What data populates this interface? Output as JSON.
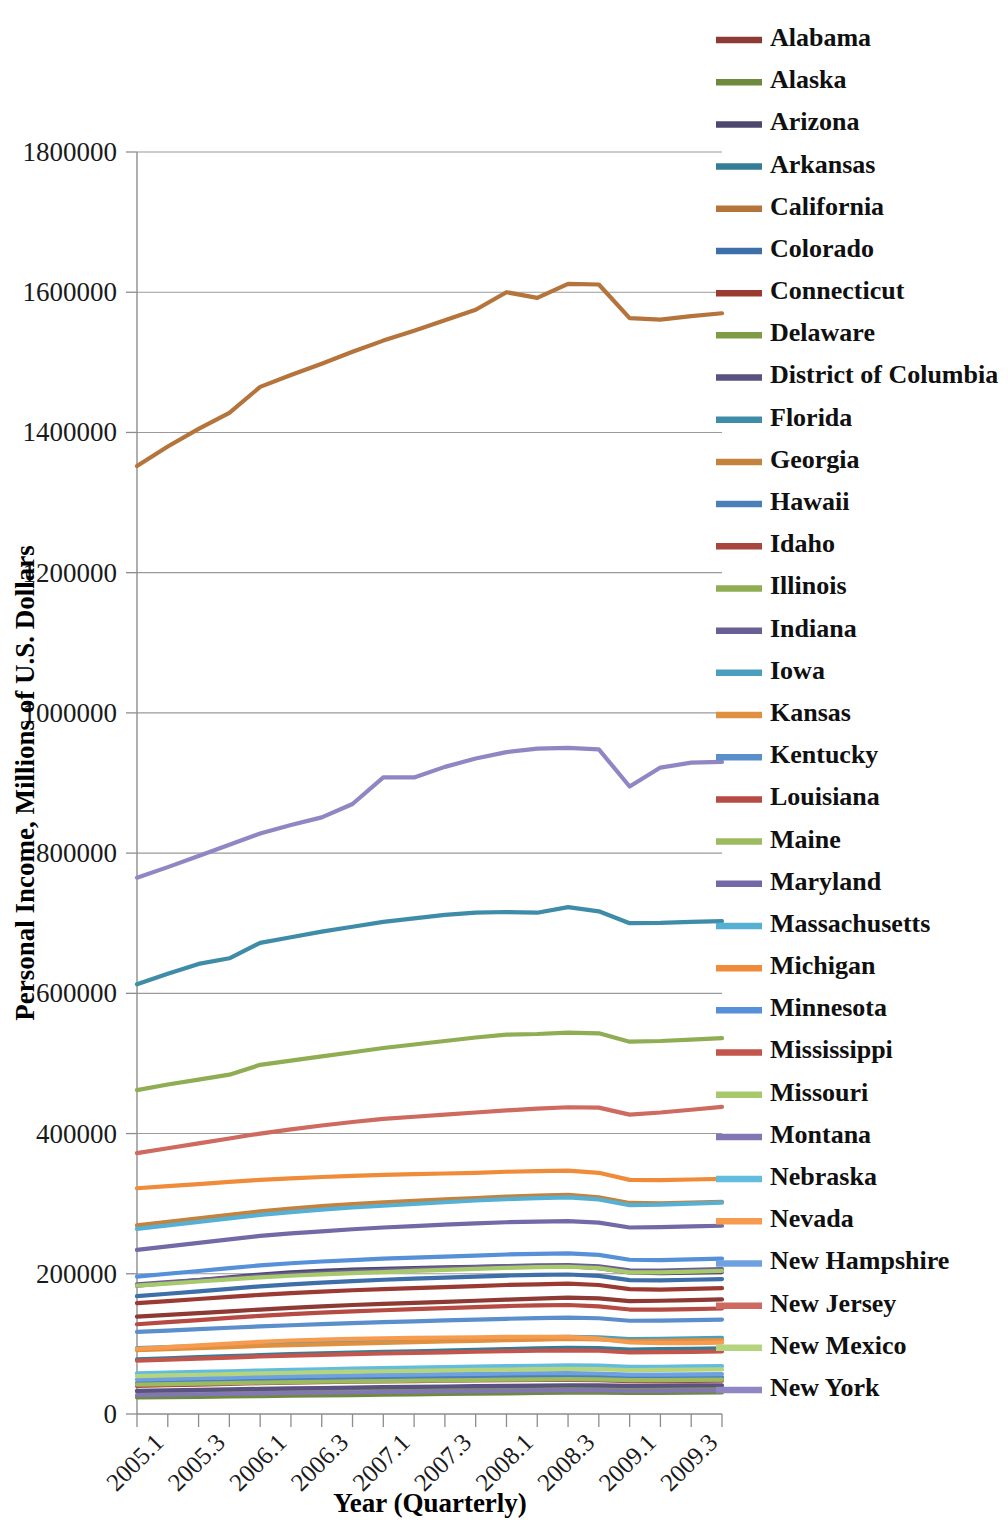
{
  "chart_data": {
    "type": "line",
    "title": "",
    "xlabel": "Year (Quarterly)",
    "ylabel": "Personal Income, Millions of U.S. Dollars",
    "grid": true,
    "legend_position": "right",
    "ylim": [
      0,
      1800000
    ],
    "yticks": [
      "0",
      "200000",
      "400000",
      "600000",
      "800000",
      "1000000",
      "1200000",
      "1400000",
      "1600000",
      "1800000"
    ],
    "ytick_values": [
      0,
      200000,
      400000,
      600000,
      800000,
      1000000,
      1200000,
      1400000,
      1600000,
      1800000
    ],
    "x": [
      "2005.1",
      "2005.2",
      "2005.3",
      "2005.4",
      "2006.1",
      "2006.2",
      "2006.3",
      "2006.4",
      "2007.1",
      "2007.2",
      "2007.3",
      "2007.4",
      "2008.1",
      "2008.2",
      "2008.3",
      "2008.4",
      "2009.1",
      "2009.2",
      "2009.3",
      "2009.4"
    ],
    "xtick_labels": [
      "2005.1",
      "2005.3",
      "2006.1",
      "2006.3",
      "2007.1",
      "2007.3",
      "2008.1",
      "2008.3",
      "2009.1",
      "2009.3"
    ],
    "xtick_indices": [
      0,
      2,
      4,
      6,
      8,
      10,
      12,
      14,
      16,
      18
    ],
    "series": [
      {
        "name": "Alabama",
        "color": "#8C3A33",
        "values": [
          139000,
          141500,
          144000,
          146500,
          149000,
          151500,
          153500,
          155500,
          157000,
          158500,
          160000,
          161500,
          163000,
          164500,
          166000,
          165000,
          161000,
          161500,
          162500,
          163500
        ]
      },
      {
        "name": "Alaska",
        "color": "#6E8B3D",
        "values": [
          23500,
          24000,
          24500,
          25000,
          25500,
          26000,
          26500,
          27000,
          27500,
          28000,
          28500,
          29000,
          29500,
          30000,
          30500,
          30500,
          30000,
          30200,
          30500,
          30800
        ]
      },
      {
        "name": "Arizona",
        "color": "#4F4770",
        "values": [
          183000,
          187000,
          191000,
          195000,
          199000,
          202000,
          204000,
          206000,
          207000,
          208000,
          209000,
          210000,
          210500,
          211000,
          211000,
          208000,
          202000,
          201000,
          201500,
          202500
        ]
      },
      {
        "name": "Arkansas",
        "color": "#357C96",
        "values": [
          78000,
          79500,
          81000,
          82500,
          84000,
          85500,
          86500,
          87500,
          88500,
          89500,
          90500,
          91500,
          92500,
          93500,
          94500,
          94000,
          92000,
          92500,
          93000,
          93500
        ]
      },
      {
        "name": "California",
        "color": "#B5743C",
        "values": [
          1352000,
          1380000,
          1405000,
          1428000,
          1465000,
          1482000,
          1498000,
          1515000,
          1531000,
          1545000,
          1560000,
          1575000,
          1600000,
          1592000,
          1612000,
          1611000,
          1563000,
          1561000,
          1566000,
          1570000
        ]
      },
      {
        "name": "Colorado",
        "color": "#3E6FA8",
        "values": [
          168000,
          171500,
          175000,
          178500,
          182000,
          185000,
          187500,
          189500,
          191500,
          193000,
          194500,
          196000,
          197500,
          198500,
          199000,
          197000,
          191000,
          190500,
          191500,
          192500
        ]
      },
      {
        "name": "Connecticut",
        "color": "#9B3A33",
        "values": [
          158000,
          161000,
          164000,
          167000,
          170000,
          172500,
          174500,
          176500,
          178000,
          179500,
          181000,
          182500,
          184000,
          185000,
          186000,
          184000,
          178000,
          177500,
          178500,
          179500
        ]
      },
      {
        "name": "Delaware",
        "color": "#7E9B46",
        "values": [
          32000,
          32600,
          33200,
          33800,
          34400,
          35000,
          35500,
          36000,
          36400,
          36800,
          37200,
          37600,
          38000,
          38300,
          38600,
          38300,
          37500,
          37600,
          37900,
          38200
        ]
      },
      {
        "name": "District of Columbia",
        "color": "#5A5280",
        "values": [
          33000,
          33700,
          34400,
          35100,
          35800,
          36500,
          37100,
          37700,
          38200,
          38700,
          39200,
          39700,
          40200,
          40600,
          41000,
          40800,
          40200,
          40400,
          40700,
          41000
        ]
      },
      {
        "name": "Florida",
        "color": "#3F8CA8",
        "values": [
          613000,
          628000,
          642000,
          650000,
          672000,
          680000,
          688000,
          695000,
          702000,
          707000,
          712000,
          715000,
          716000,
          715000,
          723000,
          717000,
          700000,
          700500,
          702000,
          703000
        ]
      },
      {
        "name": "Georgia",
        "color": "#C4823F",
        "values": [
          269000,
          274000,
          279000,
          284000,
          289000,
          293000,
          296500,
          299500,
          302000,
          304000,
          306000,
          308000,
          310000,
          311500,
          312500,
          309000,
          301000,
          300500,
          301500,
          302500
        ]
      },
      {
        "name": "Hawaii",
        "color": "#4A7FBA",
        "values": [
          44000,
          45000,
          46000,
          47000,
          48000,
          48800,
          49500,
          50200,
          50800,
          51300,
          51800,
          52300,
          52800,
          53200,
          53500,
          53000,
          51500,
          51600,
          51900,
          52200
        ]
      },
      {
        "name": "Idaho",
        "color": "#A8453C",
        "values": [
          40000,
          41000,
          42000,
          43000,
          44000,
          44800,
          45500,
          46000,
          46500,
          47000,
          47400,
          47800,
          48200,
          48500,
          48700,
          48200,
          46800,
          46900,
          47200,
          47500
        ]
      },
      {
        "name": "Illinois",
        "color": "#8FAD52",
        "values": [
          462000,
          470000,
          477000,
          484000,
          498000,
          504000,
          510000,
          516000,
          522000,
          527000,
          532000,
          537000,
          541000,
          542000,
          544000,
          543000,
          531000,
          532000,
          534000,
          536000
        ]
      },
      {
        "name": "Indiana",
        "color": "#6A5F94",
        "values": [
          185000,
          188000,
          191000,
          194000,
          197000,
          199500,
          201500,
          203500,
          205000,
          206500,
          208000,
          209500,
          211000,
          212000,
          212500,
          210500,
          205000,
          204500,
          205500,
          206500
        ]
      },
      {
        "name": "Iowa",
        "color": "#4C9EBF",
        "values": [
          94000,
          95500,
          97000,
          98500,
          100000,
          101200,
          102400,
          103400,
          104400,
          105400,
          106400,
          107400,
          108400,
          109200,
          110000,
          109400,
          107000,
          107300,
          107900,
          108500
        ]
      },
      {
        "name": "Kansas",
        "color": "#E0913F",
        "values": [
          91000,
          92500,
          94000,
          95500,
          97000,
          98200,
          99400,
          100400,
          101400,
          102400,
          103400,
          104400,
          105400,
          106200,
          107000,
          106400,
          104000,
          104300,
          104900,
          105500
        ]
      },
      {
        "name": "Kentucky",
        "color": "#5B8FCC",
        "values": [
          117000,
          119000,
          121000,
          123000,
          125000,
          126600,
          128200,
          129600,
          131000,
          132200,
          133400,
          134600,
          135800,
          136800,
          137600,
          136600,
          133000,
          133300,
          134000,
          134700
        ]
      },
      {
        "name": "Louisiana",
        "color": "#B54B42",
        "values": [
          128000,
          131000,
          134000,
          137000,
          140000,
          142500,
          144500,
          146500,
          148000,
          149500,
          151000,
          152500,
          154000,
          155000,
          155500,
          153500,
          149000,
          148800,
          149500,
          150500
        ]
      },
      {
        "name": "Maine",
        "color": "#9CBA5E",
        "values": [
          42000,
          42700,
          43400,
          44100,
          44800,
          45400,
          46000,
          46500,
          47000,
          47500,
          48000,
          48500,
          49000,
          49400,
          49800,
          49400,
          48200,
          48300,
          48600,
          48900
        ]
      },
      {
        "name": "Maryland",
        "color": "#7568A6",
        "values": [
          234000,
          239000,
          244000,
          249000,
          254000,
          257500,
          260500,
          263500,
          266000,
          268000,
          270000,
          272000,
          273500,
          274500,
          275000,
          273000,
          266000,
          266500,
          267500,
          268500
        ]
      },
      {
        "name": "Massachusetts",
        "color": "#56B0D4",
        "values": [
          264000,
          269000,
          274000,
          279000,
          284000,
          288000,
          291500,
          294500,
          297000,
          299500,
          302000,
          304500,
          306500,
          308000,
          309000,
          306000,
          298000,
          298500,
          300000,
          301500
        ]
      },
      {
        "name": "Michigan",
        "color": "#F08B3A",
        "values": [
          322000,
          325000,
          328000,
          331000,
          334000,
          336000,
          338000,
          339500,
          341000,
          342000,
          343000,
          344000,
          345500,
          346500,
          347000,
          344000,
          334000,
          333500,
          334500,
          335500
        ]
      },
      {
        "name": "Minnesota",
        "color": "#5590D8",
        "values": [
          196000,
          200000,
          204000,
          208000,
          212000,
          215000,
          217500,
          219500,
          221500,
          223000,
          224500,
          226000,
          227500,
          228500,
          229000,
          227000,
          220000,
          219500,
          220500,
          221500
        ]
      },
      {
        "name": "Mississippi",
        "color": "#C2564C",
        "values": [
          76000,
          77500,
          79000,
          80500,
          82000,
          83200,
          84400,
          85400,
          86400,
          87200,
          88000,
          88800,
          89600,
          90200,
          90800,
          90200,
          88000,
          88200,
          88700,
          89200
        ]
      },
      {
        "name": "Missouri",
        "color": "#A8C96B",
        "values": [
          183000,
          186000,
          189000,
          192000,
          195000,
          197200,
          199200,
          201000,
          202500,
          204000,
          205500,
          207000,
          208500,
          209500,
          210000,
          208000,
          202000,
          202000,
          203000,
          204000
        ]
      },
      {
        "name": "Montana",
        "color": "#8276B4",
        "values": [
          27000,
          27600,
          28200,
          28800,
          29400,
          30000,
          30500,
          31000,
          31400,
          31800,
          32200,
          32600,
          33000,
          33400,
          33800,
          33600,
          32800,
          32900,
          33200,
          33500
        ]
      },
      {
        "name": "Nebraska",
        "color": "#62BCDE",
        "values": [
          58000,
          59000,
          60000,
          61000,
          62000,
          62900,
          63800,
          64600,
          65400,
          66100,
          66800,
          67500,
          68200,
          68800,
          69400,
          68900,
          67200,
          67400,
          67800,
          68200
        ]
      },
      {
        "name": "Nevada",
        "color": "#F79B4E",
        "values": [
          93000,
          95500,
          98000,
          100500,
          103000,
          104800,
          106200,
          107200,
          108000,
          108500,
          109000,
          109500,
          110000,
          110200,
          110000,
          107500,
          102000,
          101000,
          101200,
          101800
        ]
      },
      {
        "name": "New Hampshire",
        "color": "#6FA0E0",
        "values": [
          49000,
          50000,
          51000,
          52000,
          53000,
          53800,
          54600,
          55200,
          55800,
          56300,
          56800,
          57300,
          57800,
          58100,
          58400,
          57800,
          56200,
          56300,
          56600,
          56900
        ]
      },
      {
        "name": "New Jersey",
        "color": "#CE6A60",
        "values": [
          372000,
          379000,
          386000,
          393000,
          400000,
          406000,
          411500,
          416500,
          421000,
          424000,
          427000,
          430000,
          433000,
          435500,
          437500,
          437000,
          427000,
          430000,
          434000,
          438000
        ]
      },
      {
        "name": "New Mexico",
        "color": "#B5D47E",
        "values": [
          54000,
          55000,
          56000,
          57000,
          58000,
          58800,
          59600,
          60300,
          61000,
          61600,
          62200,
          62800,
          63400,
          63900,
          64400,
          64000,
          62600,
          62800,
          63200,
          63600
        ]
      },
      {
        "name": "New York",
        "color": "#9186C4",
        "values": [
          765000,
          780000,
          796000,
          812000,
          828000,
          840000,
          851000,
          870000,
          908000,
          908000,
          923000,
          935000,
          944000,
          949000,
          950000,
          948000,
          895000,
          922000,
          929000,
          930000
        ]
      }
    ]
  },
  "axes": {
    "y_title": "Personal Income, Millions of U.S. Dollars",
    "x_title": "Year (Quarterly)"
  }
}
